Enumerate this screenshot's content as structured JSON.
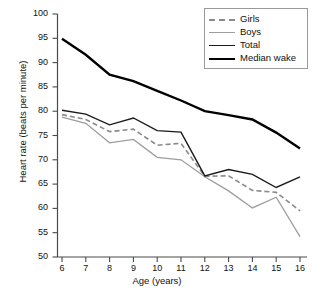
{
  "chart_data": {
    "type": "line",
    "title": "",
    "xlabel": "Age (years)",
    "ylabel": "Heart rate (beats per minute)",
    "x": [
      6,
      7,
      8,
      9,
      10,
      11,
      12,
      13,
      14,
      15,
      16
    ],
    "xlim": [
      5.5,
      16.5
    ],
    "ylim": [
      50,
      100
    ],
    "yticks": [
      50,
      55,
      60,
      65,
      70,
      75,
      80,
      85,
      90,
      95,
      100
    ],
    "xticks": [
      6,
      7,
      8,
      9,
      10,
      11,
      12,
      13,
      14,
      15,
      16
    ],
    "grid": false,
    "legend_position": "top-right",
    "series": [
      {
        "name": "Girls",
        "style": "dashed",
        "color": "#8a8a8a",
        "width": 1.6,
        "values": [
          79.3,
          78.3,
          75.8,
          76.3,
          73.0,
          73.4,
          66.6,
          66.7,
          63.7,
          63.3,
          59.5
        ]
      },
      {
        "name": "Boys",
        "style": "solid",
        "color": "#9d9d9d",
        "width": 1.3,
        "values": [
          78.8,
          77.5,
          73.5,
          74.2,
          70.5,
          70.0,
          66.5,
          63.6,
          60.1,
          62.3,
          54.2
        ]
      },
      {
        "name": "Total",
        "style": "solid",
        "color": "#1a1a1a",
        "width": 1.4,
        "values": [
          80.2,
          79.4,
          77.2,
          78.6,
          76.0,
          75.7,
          66.7,
          68.0,
          67.0,
          64.3,
          66.5
        ]
      },
      {
        "name": "Median wake",
        "style": "solid",
        "color": "#000000",
        "width": 2.4,
        "values": [
          94.9,
          91.6,
          87.5,
          86.2,
          84.2,
          82.2,
          80.0,
          79.2,
          78.3,
          75.6,
          72.3
        ]
      }
    ]
  },
  "axes": {
    "y_tick_labels": [
      "100",
      "95",
      "90",
      "85",
      "80",
      "75",
      "70",
      "65",
      "60",
      "55",
      "50"
    ],
    "x_tick_labels": [
      "6",
      "7",
      "8",
      "9",
      "10",
      "11",
      "12",
      "13",
      "14",
      "15",
      "16"
    ],
    "y_axis_title": "Heart rate (beats per minute)",
    "x_axis_title": "Age (years)"
  },
  "legend": {
    "items": [
      {
        "label": "Girls"
      },
      {
        "label": "Boys"
      },
      {
        "label": "Total"
      },
      {
        "label": "Median wake"
      }
    ]
  }
}
